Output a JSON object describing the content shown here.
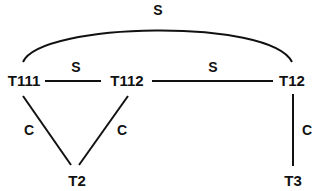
{
  "diagram": {
    "type": "graph",
    "nodes": [
      {
        "id": "T111",
        "label": "T111"
      },
      {
        "id": "T112",
        "label": "T112"
      },
      {
        "id": "T12",
        "label": "T12"
      },
      {
        "id": "T2",
        "label": "T2"
      },
      {
        "id": "T3",
        "label": "T3"
      }
    ],
    "edges": [
      {
        "from": "T111",
        "to": "T12",
        "label": "S",
        "shape": "arc"
      },
      {
        "from": "T111",
        "to": "T112",
        "label": "S"
      },
      {
        "from": "T112",
        "to": "T12",
        "label": "S"
      },
      {
        "from": "T111",
        "to": "T2",
        "label": "C"
      },
      {
        "from": "T112",
        "to": "T2",
        "label": "C"
      },
      {
        "from": "T12",
        "to": "T3",
        "label": "C"
      }
    ],
    "colors": {
      "ink": "#111111",
      "background": "#ffffff"
    }
  }
}
